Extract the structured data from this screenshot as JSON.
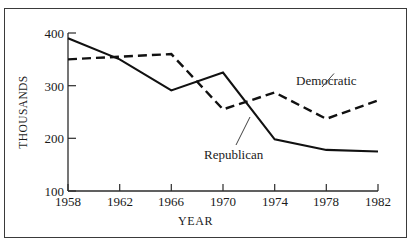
{
  "chart_data": {
    "type": "line",
    "title": "",
    "xlabel": "YEAR",
    "ylabel": "THOUSANDS",
    "x": [
      1958,
      1962,
      1966,
      1970,
      1974,
      1978,
      1982
    ],
    "xtick_labels": [
      "1958",
      "1962",
      "1966",
      "1970",
      "1974",
      "1978",
      "1982"
    ],
    "ytick_labels": [
      "400",
      "300",
      "200",
      "100"
    ],
    "ytick_values": [
      400,
      300,
      200,
      100
    ],
    "xlim": [
      1958,
      1982
    ],
    "ylim": [
      100,
      400
    ],
    "grid": false,
    "legend_position": "inline-annotations",
    "series": [
      {
        "name": "Republican",
        "style": "solid",
        "color": "#111111",
        "values": [
          390,
          350,
          291,
          325,
          198,
          178,
          175
        ]
      },
      {
        "name": "Democratic",
        "style": "dashed",
        "color": "#111111",
        "values": [
          350,
          355,
          360,
          255,
          287,
          237,
          272
        ]
      }
    ],
    "annotations": [
      {
        "name": "Democratic",
        "text": "Democratic",
        "leader_from": [
          1978,
          237
        ],
        "leader_to_label": true
      },
      {
        "name": "Republican",
        "text": "Republican",
        "leader_from": [
          1972,
          262
        ],
        "leader_to_label": true
      }
    ]
  },
  "axes": {
    "ylabel": "THOUSANDS",
    "xlabel": "YEAR",
    "yticks": [
      "400",
      "300",
      "200",
      "100"
    ],
    "xticks": [
      "1958",
      "1962",
      "1966",
      "1970",
      "1974",
      "1978",
      "1982"
    ]
  },
  "annotations": {
    "democratic": "Democratic",
    "republican": "Republican"
  },
  "colors": {
    "line": "#111111",
    "axis": "#2b2b2b",
    "frame": "#3a3a3a",
    "background": "#ffffff"
  }
}
